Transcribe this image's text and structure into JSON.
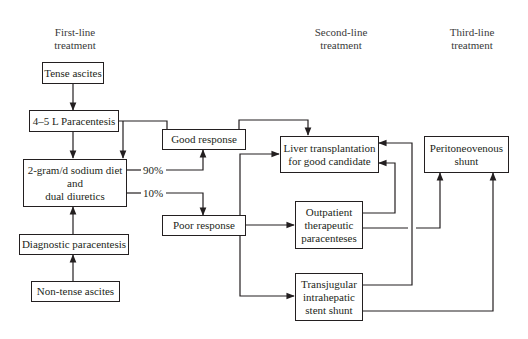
{
  "headers": {
    "first_line": [
      "First-line",
      "treatment"
    ],
    "second_line": [
      "Second-line",
      "treatment"
    ],
    "third_line": [
      "Third-line",
      "treatment"
    ]
  },
  "nodes": {
    "tense_ascites": "Tense ascites",
    "paracentesis": "4–5 L Paracentesis",
    "diet": [
      "2-gram/d sodium diet",
      "and",
      "dual diuretics"
    ],
    "diagnostic_paracentesis": "Diagnostic paracentesis",
    "non_tense_ascites": "Non-tense ascites",
    "good_response": "Good response",
    "poor_response": "Poor response",
    "liver_transplant": [
      "Liver transplantation",
      "for good candidate"
    ],
    "outpatient": [
      "Outpatient",
      "therapeutic",
      "paracenteses"
    ],
    "tips": [
      "Transjugular",
      "intrahepatic",
      "stent shunt"
    ],
    "peritoneovenous": [
      "Peritoneovenous",
      "shunt"
    ]
  },
  "edge_labels": {
    "good_pct": "90%",
    "poor_pct": "10%"
  },
  "colors": {
    "line": "#231f20",
    "background": "#ffffff"
  }
}
